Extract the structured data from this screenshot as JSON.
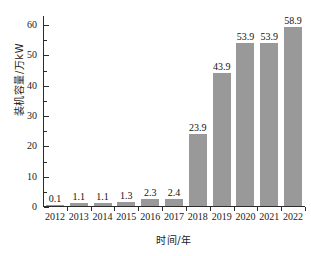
{
  "chart_data": {
    "type": "bar",
    "title": "",
    "subtitle": "",
    "xlabel": "时间/年",
    "ylabel": "装机容量/万kW",
    "categories": [
      "2012",
      "2013",
      "2014",
      "2015",
      "2016",
      "2017",
      "2018",
      "2019",
      "2020",
      "2021",
      "2022"
    ],
    "values": [
      0.1,
      1.1,
      1.1,
      1.3,
      2.3,
      2.4,
      23.9,
      43.9,
      53.9,
      53.9,
      58.9
    ],
    "value_labels": [
      "0.1",
      "1.1",
      "1.1",
      "1.3",
      "2.3",
      "2.4",
      "23.9",
      "43.9",
      "53.9",
      "53.9",
      "58.9"
    ],
    "ylim": [
      0,
      63
    ],
    "ytick_values": [
      0,
      10,
      20,
      30,
      40,
      50,
      60
    ],
    "ytick_labels": [
      "0",
      "10",
      "20",
      "30",
      "40",
      "50",
      "60"
    ],
    "yminor_values": [
      5,
      15,
      25,
      35,
      45,
      55
    ],
    "grid": false,
    "legend": null,
    "legend_position": "none",
    "bar_color": "#999999",
    "axis_color": "#2b2b2b",
    "text_color": "#111111",
    "background_color": "#ffffff"
  }
}
